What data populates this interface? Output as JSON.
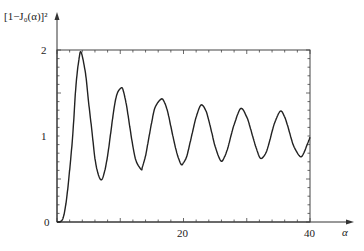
{
  "chart_data": {
    "type": "line",
    "title": "",
    "ylabel": "[1−J₀(α)]²",
    "xlabel": "α",
    "xlim": [
      0,
      40
    ],
    "ylim": [
      0,
      2
    ],
    "x_ticks": [
      0,
      20,
      40
    ],
    "x_tick_labels": [
      "",
      "20",
      "40"
    ],
    "y_ticks": [
      0,
      1,
      2
    ],
    "y_tick_labels": [
      "0",
      "1",
      "2"
    ],
    "grid": false,
    "frame": true,
    "legend": null,
    "series": [
      {
        "name": "[1−J₀(α)]²",
        "x": [
          0,
          0.5,
          1,
          1.5,
          2,
          2.5,
          3,
          3.5,
          3.83,
          4.5,
          5,
          5.5,
          6,
          6.5,
          7.02,
          7.5,
          8,
          8.5,
          9,
          9.5,
          10.17,
          10.5,
          11,
          11.5,
          12,
          12.5,
          13.32,
          13.5,
          14,
          14.5,
          15,
          15.5,
          16.47,
          17,
          17.5,
          18,
          18.5,
          19,
          19.62,
          20,
          20.5,
          21,
          21.5,
          22,
          22.76,
          23.5,
          24,
          24.5,
          25,
          25.9,
          26.5,
          27,
          27.5,
          28,
          29.05,
          30,
          30.5,
          31,
          31.5,
          32.19,
          33,
          33.5,
          34,
          34.5,
          35.33,
          36,
          36.5,
          37,
          37.5,
          38.47,
          39,
          39.5,
          40
        ],
        "values": [
          0,
          0.004,
          0.055,
          0.262,
          0.604,
          1.021,
          1.588,
          1.905,
          1.97,
          1.73,
          1.39,
          1.07,
          0.74,
          0.56,
          0.49,
          0.58,
          0.77,
          1.04,
          1.31,
          1.49,
          1.56,
          1.52,
          1.35,
          1.11,
          0.88,
          0.71,
          0.61,
          0.64,
          0.77,
          0.97,
          1.17,
          1.33,
          1.43,
          1.39,
          1.28,
          1.11,
          0.94,
          0.79,
          0.67,
          0.69,
          0.76,
          0.91,
          1.07,
          1.22,
          1.36,
          1.3,
          1.18,
          1.03,
          0.88,
          0.71,
          0.76,
          0.86,
          1.0,
          1.13,
          1.32,
          1.22,
          1.11,
          0.98,
          0.86,
          0.74,
          0.8,
          0.91,
          1.05,
          1.17,
          1.29,
          1.22,
          1.11,
          0.98,
          0.87,
          0.76,
          0.8,
          0.89,
          0.985
        ]
      }
    ]
  },
  "axes": {
    "y_label_text": "[1−J₀(α)]²",
    "x_label_text": "α",
    "origin_label": "0",
    "y_tick_1": "1",
    "y_tick_2": "2",
    "x_tick_20": "20",
    "x_tick_40": "40"
  }
}
